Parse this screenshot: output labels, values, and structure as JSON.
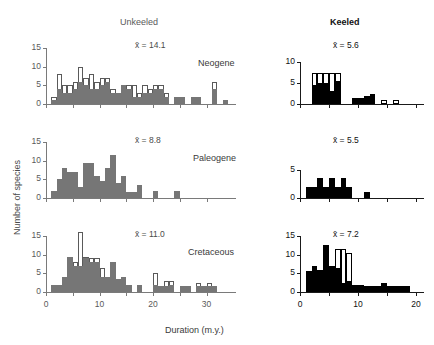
{
  "figure": {
    "column_headers": [
      {
        "label": "Unkeeled",
        "style": "regular"
      },
      {
        "label": "Keeled",
        "style": "bold"
      }
    ],
    "row_labels": [
      "Neogene",
      "Paleogene",
      "Cretaceous"
    ],
    "ylabel": "Number of species",
    "xlabel": "Duration (m.y.)",
    "mean_symbol": "x̄"
  },
  "chart_data": [
    {
      "type": "bar",
      "id": "unkeeled-neogene",
      "title": "Unkeeled",
      "annotation": "x̄ = 14.1",
      "mean": 14.1,
      "row": "Neogene",
      "xlabel": "Duration (m.y.)",
      "ylabel": "Number of species",
      "xlim": [
        0,
        34
      ],
      "ylim": [
        0,
        15
      ],
      "yticks": [
        0,
        5,
        10,
        15
      ],
      "xticks": [
        0,
        10,
        20,
        30
      ],
      "grid": false,
      "bin_width": 1,
      "series": [
        {
          "name": "filled",
          "color": "#767676",
          "bin_starts": [
            1,
            2,
            3,
            4,
            5,
            6,
            7,
            8,
            9,
            10,
            11,
            12,
            13,
            14,
            15,
            16,
            17,
            18,
            19,
            20,
            21,
            22,
            23,
            24,
            25,
            26,
            27,
            28,
            29,
            30,
            31,
            32,
            33
          ],
          "values": [
            1,
            4,
            3,
            3,
            4,
            6,
            5,
            4,
            4,
            5,
            6,
            3,
            3,
            5,
            4,
            2,
            2,
            3,
            3,
            4,
            4,
            2,
            0,
            2,
            2,
            0,
            2,
            2,
            0,
            0,
            4,
            0,
            1
          ]
        },
        {
          "name": "open-total",
          "color": "#ffffff",
          "bin_starts": [
            1,
            2,
            3,
            4,
            5,
            6,
            7,
            8,
            9,
            10,
            11,
            12,
            13,
            14,
            15,
            16,
            17,
            18,
            19,
            20,
            21,
            22,
            23,
            24,
            25,
            26,
            27,
            28,
            29,
            30,
            31,
            32,
            33
          ],
          "values": [
            2,
            8,
            5,
            5,
            6,
            10,
            7,
            8,
            6,
            7,
            7,
            4,
            3,
            5,
            5,
            5,
            3,
            5,
            4,
            5,
            5,
            3,
            0,
            2,
            2,
            0,
            2,
            2,
            0,
            0,
            6,
            0,
            1
          ]
        }
      ]
    },
    {
      "type": "bar",
      "id": "keeled-neogene",
      "title": "Keeled",
      "annotation": "x̄ = 5.6",
      "mean": 5.6,
      "row": "Neogene",
      "xlim": [
        0,
        20
      ],
      "ylim": [
        0,
        10
      ],
      "yticks": [
        0,
        5,
        10
      ],
      "grid": false,
      "bin_width": 1,
      "series": [
        {
          "name": "filled",
          "color": "#000000",
          "bin_starts": [
            1,
            2,
            3,
            4,
            5,
            6,
            7,
            8,
            9,
            10,
            11,
            12,
            13,
            14,
            15,
            16,
            17
          ],
          "values": [
            0,
            4.5,
            5,
            5,
            3,
            5.5,
            0,
            0,
            1.5,
            1.5,
            2,
            2.5,
            0,
            0,
            0,
            0,
            0
          ]
        },
        {
          "name": "open-total",
          "color": "#ffffff",
          "bin_starts": [
            1,
            2,
            3,
            4,
            5,
            6,
            7,
            8,
            9,
            10,
            11,
            12,
            13,
            14,
            15,
            16,
            17
          ],
          "values": [
            0,
            7.5,
            7.5,
            7.5,
            7.5,
            7.5,
            0,
            0,
            1.5,
            1.5,
            2,
            2.5,
            0,
            1,
            0,
            1,
            0
          ]
        }
      ]
    },
    {
      "type": "bar",
      "id": "unkeeled-paleogene",
      "title": "Unkeeled",
      "annotation": "x̄ = 8.8",
      "mean": 8.8,
      "row": "Paleogene",
      "xlim": [
        0,
        34
      ],
      "ylim": [
        0,
        15
      ],
      "yticks": [
        0,
        5,
        10,
        15
      ],
      "grid": false,
      "bin_width": 1,
      "series": [
        {
          "name": "filled",
          "color": "#767676",
          "bin_starts": [
            1,
            2,
            3,
            4,
            5,
            6,
            7,
            8,
            9,
            10,
            11,
            12,
            13,
            14,
            15,
            16,
            17,
            18,
            19,
            20,
            21,
            22,
            23,
            24,
            25
          ],
          "values": [
            2,
            5,
            8,
            7,
            7,
            3,
            9.5,
            9.5,
            6,
            4.5,
            8,
            11.5,
            4,
            6,
            1.5,
            1.5,
            3.5,
            0,
            0,
            2,
            0,
            0,
            0,
            2,
            0
          ]
        }
      ]
    },
    {
      "type": "bar",
      "id": "keeled-paleogene",
      "title": "Keeled",
      "annotation": "x̄ = 5.5",
      "mean": 5.5,
      "row": "Paleogene",
      "xlim": [
        0,
        20
      ],
      "ylim": [
        0,
        5
      ],
      "yticks": [
        0,
        5
      ],
      "grid": false,
      "bin_width": 1,
      "series": [
        {
          "name": "filled",
          "color": "#000000",
          "bin_starts": [
            1,
            2,
            3,
            4,
            5,
            6,
            7,
            8,
            9,
            10,
            11,
            12
          ],
          "values": [
            2,
            2,
            3.5,
            2,
            3.5,
            2,
            3.5,
            2,
            0,
            0,
            1,
            0
          ]
        }
      ]
    },
    {
      "type": "bar",
      "id": "unkeeled-cretaceous",
      "title": "Unkeeled",
      "annotation": "x̄ = 11.0",
      "mean": 11.0,
      "row": "Cretaceous",
      "xlim": [
        0,
        34
      ],
      "ylim": [
        0,
        15
      ],
      "yticks": [
        0,
        5,
        10,
        15
      ],
      "xticks": [
        0,
        10,
        20,
        30
      ],
      "grid": false,
      "bin_width": 1,
      "series": [
        {
          "name": "filled",
          "color": "#767676",
          "bin_starts": [
            1,
            2,
            3,
            4,
            5,
            6,
            7,
            8,
            9,
            10,
            11,
            12,
            13,
            14,
            15,
            16,
            17,
            18,
            19,
            20,
            21,
            22,
            23,
            24,
            25,
            26,
            27,
            28,
            29,
            30,
            31
          ],
          "values": [
            2,
            2,
            4,
            9.5,
            7,
            7,
            9,
            8,
            8,
            4,
            4,
            8,
            3.5,
            4,
            2,
            0,
            2,
            0,
            0,
            2,
            1.5,
            1.5,
            2,
            0,
            1.5,
            1.5,
            0,
            1.5,
            1.5,
            1.5,
            1.5
          ]
        },
        {
          "name": "open-total",
          "color": "#ffffff",
          "bin_starts": [
            1,
            2,
            3,
            4,
            5,
            6,
            7,
            8,
            9,
            10,
            11,
            12,
            13,
            14,
            15,
            16,
            17,
            18,
            19,
            20,
            21,
            22,
            23,
            24,
            25,
            26,
            27,
            28,
            29,
            30,
            31
          ],
          "values": [
            2,
            2,
            4,
            9.5,
            8,
            16,
            9.5,
            9,
            9,
            6.5,
            4,
            8,
            3.5,
            4,
            2,
            0,
            2,
            0,
            0,
            5,
            1.5,
            3,
            3,
            0,
            1.5,
            1.5,
            0,
            2.5,
            1.5,
            2.5,
            1.5
          ]
        }
      ]
    },
    {
      "type": "bar",
      "id": "keeled-cretaceous",
      "title": "Keeled",
      "annotation": "x̄ = 7.2",
      "mean": 7.2,
      "row": "Cretaceous",
      "xlim": [
        0,
        20
      ],
      "ylim": [
        0,
        15
      ],
      "yticks": [
        0,
        5,
        10,
        15
      ],
      "xticks": [
        0,
        10,
        20
      ],
      "grid": false,
      "bin_width": 1,
      "series": [
        {
          "name": "filled",
          "color": "#000000",
          "bin_starts": [
            1,
            2,
            3,
            4,
            5,
            6,
            7,
            8,
            9,
            10,
            11,
            12,
            13,
            14,
            15,
            16,
            17,
            18
          ],
          "values": [
            5.5,
            7,
            6,
            12.5,
            7,
            6.5,
            2.5,
            3,
            2,
            2,
            1.5,
            1.5,
            1.5,
            2.5,
            1.5,
            1.5,
            1.5,
            1.5
          ]
        },
        {
          "name": "open-total",
          "color": "#ffffff",
          "bin_starts": [
            1,
            2,
            3,
            4,
            5,
            6,
            7,
            8,
            9,
            10,
            11,
            12,
            13,
            14,
            15,
            16,
            17,
            18
          ],
          "values": [
            5.5,
            7,
            6,
            12.5,
            7,
            11.5,
            11.5,
            10.5,
            2,
            2,
            1.5,
            1.5,
            1.5,
            2.5,
            1.5,
            1.5,
            1.5,
            1.5
          ]
        }
      ]
    }
  ]
}
